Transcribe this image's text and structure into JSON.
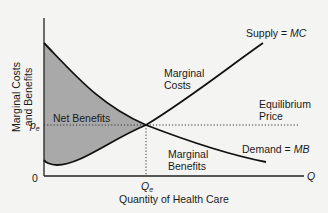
{
  "diagram": {
    "y_axis_label_line1": "Marginal Costs",
    "y_axis_label_line2": "and Benefits",
    "x_axis_label": "Quantity of Health Care",
    "x_axis_end_label": "Q",
    "origin_label": "0",
    "equilibrium_price_symbol": "p",
    "equilibrium_price_subscript": "e",
    "equilibrium_quantity_symbol": "Q",
    "equilibrium_quantity_subscript": "e",
    "supply_label_prefix": "Supply = ",
    "supply_label_var": "MC",
    "demand_label_prefix": "Demand = ",
    "demand_label_var": "MB",
    "marginal_costs_line1": "Marginal",
    "marginal_costs_line2": "Costs",
    "marginal_benefits_line1": "Marginal",
    "marginal_benefits_line2": "Benefits",
    "net_benefits_label": "Net Benefits",
    "equilibrium_price_line1": "Equilibrium",
    "equilibrium_price_line2": "Price",
    "colors": {
      "shaded_area": "#a9a9a9",
      "curve": "#111111",
      "background": "#f4f4f2"
    }
  }
}
